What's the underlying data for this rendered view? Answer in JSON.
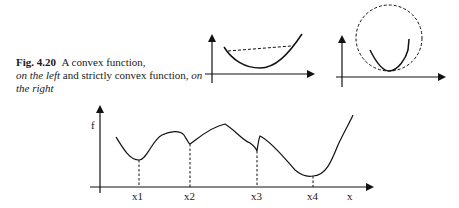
{
  "caption": {
    "fig_label": "Fig. 4.20",
    "text_1": "A convex function,",
    "left_phrase": "on the left",
    "text_2": " and strictly convex function, ",
    "right_phrase": "on the right"
  },
  "main_plot": {
    "y_label": "f",
    "x_label": "x",
    "x_ticks": [
      "x1",
      "x2",
      "x3",
      "x4"
    ]
  }
}
